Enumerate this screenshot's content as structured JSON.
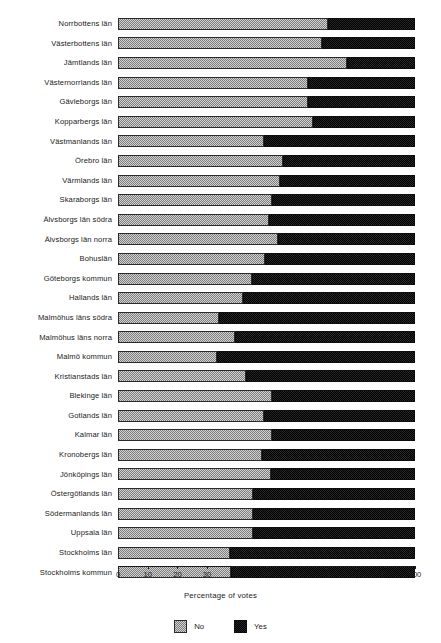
{
  "chart_data": {
    "type": "bar",
    "subtype": "stacked-horizontal-100pct",
    "title": "",
    "xlabel": "Percentage of votes",
    "ylabel": "",
    "xlim": [
      0,
      100
    ],
    "ylim": null,
    "grid": false,
    "legend_position": "bottom-center",
    "xticks": [
      "0",
      "10",
      "20",
      "30",
      "40",
      "50",
      "60",
      "70",
      "80",
      "90",
      "100"
    ],
    "xtick_values": [
      0,
      10,
      20,
      30,
      40,
      50,
      60,
      70,
      80,
      90,
      100
    ],
    "categories": [
      "Norrbottens län",
      "Västerbottens län",
      "Jämtlands län",
      "Västernorrlands län",
      "Gävleborgs län",
      "Kopparbergs län",
      "Västmanlands län",
      "Örebro län",
      "Värmlands län",
      "Skaraborgs län",
      "Älvsborgs län södra",
      "Älvsborgs län norra",
      "Bohuslän",
      "Göteborgs kommun",
      "Hallands län",
      "Malmöhus läns södra",
      "Malmöhus läns norra",
      "Malmö kommun",
      "Kristianstads län",
      "Blekinge län",
      "Gotlands län",
      "Kalmar län",
      "Kronobergs län",
      "Jönköpings län",
      "Östergötlands län",
      "Södermanlands län",
      "Uppsala län",
      "Stockholms län",
      "Stockholms kommun"
    ],
    "series": [
      {
        "name": "No",
        "color": "#b4b4b4",
        "values": [
          70.7,
          68.6,
          77.0,
          64.0,
          64.0,
          65.5,
          49.0,
          55.5,
          54.5,
          52.0,
          51.0,
          54.0,
          49.5,
          45.0,
          42.0,
          34.0,
          39.5,
          33.5,
          43.0,
          52.0,
          49.0,
          52.0,
          48.5,
          51.5,
          45.5,
          45.5,
          45.5,
          37.7,
          38.0
        ]
      },
      {
        "name": "Yes",
        "color": "#121212",
        "values": [
          29.3,
          31.4,
          23.0,
          36.0,
          36.0,
          34.5,
          51.0,
          44.5,
          45.5,
          48.0,
          49.0,
          46.0,
          50.5,
          55.0,
          58.0,
          66.0,
          60.5,
          66.5,
          57.0,
          48.0,
          51.0,
          48.0,
          51.5,
          48.5,
          54.5,
          54.5,
          54.5,
          62.3,
          62.0
        ]
      }
    ],
    "legend": [
      "No",
      "Yes"
    ]
  },
  "axis": {
    "xlabel": "Percentage of votes"
  },
  "legend": {
    "items": [
      {
        "label": "No",
        "swatch": "checkered-gray-swatch"
      },
      {
        "label": "Yes",
        "swatch": "solid-black-swatch"
      }
    ]
  }
}
